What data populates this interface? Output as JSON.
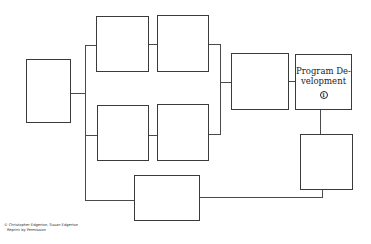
{
  "diagram": {
    "boxes": {
      "left": {
        "label": ""
      },
      "top_1": {
        "label": ""
      },
      "top_2": {
        "label": ""
      },
      "bottom_1": {
        "label": ""
      },
      "bottom_2": {
        "label": ""
      },
      "middle": {
        "label": ""
      },
      "program_development": {
        "label": "Program De-velopment",
        "line1": "Program De-",
        "line2": "velopment",
        "badge": "1"
      },
      "right_lower": {
        "label": ""
      },
      "bottom": {
        "label": ""
      }
    },
    "credit": {
      "line1": "© Christopher Edgerton, Susan Edgerton",
      "line2": "Reprint by Permission"
    }
  }
}
